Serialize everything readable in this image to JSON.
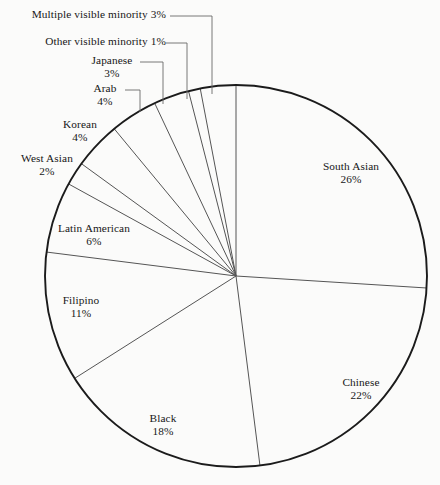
{
  "chart_data": {
    "type": "pie",
    "title": "",
    "subtitle": "",
    "xlabel": "",
    "ylabel": "",
    "legend_position": "none",
    "grid": false,
    "value_unit": "%",
    "start_angle_deg": 0,
    "direction": "clockwise",
    "total": 100,
    "categories": [
      "South Asian",
      "Chinese",
      "Black",
      "Filipino",
      "Latin American",
      "West Asian",
      "Korean",
      "Arab",
      "Japanese",
      "Other visible minority",
      "Multiple visible minority"
    ],
    "values": [
      26,
      22,
      18,
      11,
      6,
      2,
      4,
      4,
      3,
      1,
      3
    ],
    "slices": [
      {
        "label": "South Asian",
        "value": 26,
        "value_text": "26%",
        "label_style": "inside",
        "color": "#ffffff"
      },
      {
        "label": "Chinese",
        "value": 22,
        "value_text": "22%",
        "label_style": "inside",
        "color": "#ffffff"
      },
      {
        "label": "Black",
        "value": 18,
        "value_text": "18%",
        "label_style": "inside",
        "color": "#ffffff"
      },
      {
        "label": "Filipino",
        "value": 11,
        "value_text": "11%",
        "label_style": "inside",
        "color": "#ffffff"
      },
      {
        "label": "Latin American",
        "value": 6,
        "value_text": "6%",
        "label_style": "outside",
        "color": "#ffffff"
      },
      {
        "label": "West Asian",
        "value": 2,
        "value_text": "2%",
        "label_style": "outside",
        "color": "#ffffff"
      },
      {
        "label": "Korean",
        "value": 4,
        "value_text": "4%",
        "label_style": "outside",
        "color": "#ffffff"
      },
      {
        "label": "Arab",
        "value": 4,
        "value_text": "4%",
        "label_style": "outside",
        "color": "#ffffff"
      },
      {
        "label": "Japanese",
        "value": 3,
        "value_text": "3%",
        "label_style": "leader",
        "color": "#ffffff"
      },
      {
        "label": "Other visible minority",
        "value": 1,
        "value_text": "1%",
        "label_style": "leader-inline",
        "color": "#ffffff"
      },
      {
        "label": "Multiple visible minority",
        "value": 3,
        "value_text": "3%",
        "label_style": "leader-inline",
        "color": "#ffffff"
      }
    ]
  },
  "labels": {
    "multiple_visible_minority": "Multiple visible minority 3%",
    "other_visible_minority": "Other visible minority 1%",
    "japanese_name": "Japanese",
    "japanese_value": "3%",
    "arab_name": "Arab",
    "arab_value": "4%",
    "korean_name": "Korean",
    "korean_value": "4%",
    "west_asian_name": "West Asian",
    "west_asian_value": "2%",
    "latin_american_name": "Latin American",
    "latin_american_value": "6%",
    "filipino_name": "Filipino",
    "filipino_value": "11%",
    "black_name": "Black",
    "black_value": "18%",
    "chinese_name": "Chinese",
    "chinese_value": "22%",
    "south_asian_name": "South Asian",
    "south_asian_value": "26%"
  },
  "style": {
    "background": "#fbfbfa",
    "outline_color": "#1b1b1b",
    "divider_color": "#555555",
    "leader_color": "#6a6a6a",
    "text_color": "#171717"
  }
}
